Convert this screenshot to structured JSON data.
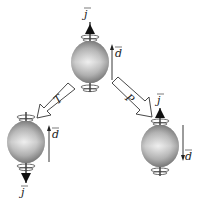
{
  "diagram": {
    "colors": {
      "stroke": "#222222",
      "sphere_light": "#f2f2f2",
      "sphere_dark": "#6a6a6a",
      "background": "#ffffff"
    },
    "nodes": [
      {
        "id": "original",
        "spin_label": "j",
        "dipole_label": "d",
        "spin_dir": "up",
        "dipole_dir": "up"
      },
      {
        "id": "time-reversed",
        "spin_label": "j",
        "dipole_label": "d",
        "spin_dir": "down",
        "dipole_dir": "up"
      },
      {
        "id": "parity",
        "spin_label": "j",
        "dipole_label": "d",
        "spin_dir": "up",
        "dipole_dir": "down"
      }
    ],
    "transforms": [
      {
        "id": "T",
        "label": "T",
        "from": "original",
        "to": "time-reversed"
      },
      {
        "id": "P",
        "label": "P",
        "from": "original",
        "to": "parity"
      }
    ]
  }
}
